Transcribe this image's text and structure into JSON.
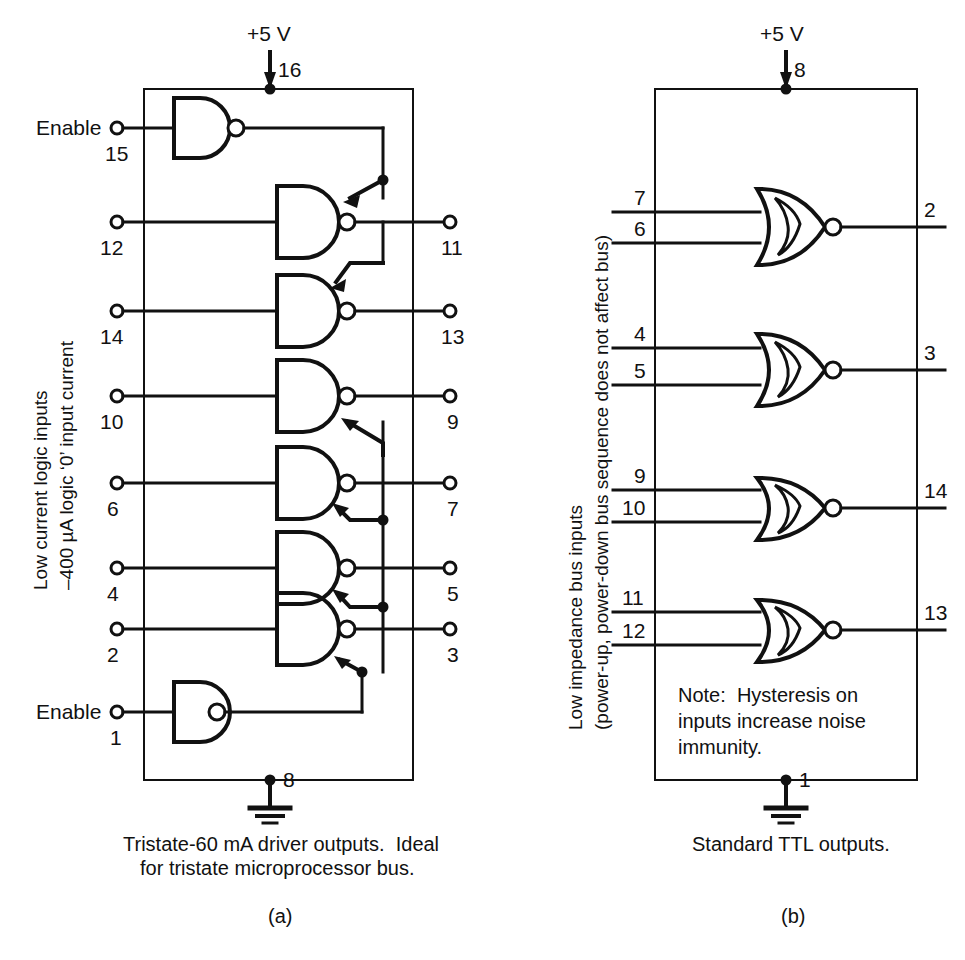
{
  "figure": {
    "stroke_color": "#111111",
    "background_color": "#ffffff"
  },
  "panel_a": {
    "id": "a",
    "figure_label": "(a)",
    "supply_label": "+5 V",
    "supply_pin": "16",
    "ground_pin": "8",
    "side_label_line1": "Low current logic inputs",
    "side_label_line2": "–400 µA logic ‘0’ input current",
    "caption_line1": "Tristate-60 mA driver outputs.  Ideal",
    "caption_line2": "for tristate microprocessor bus.",
    "enable_label_top": "Enable",
    "enable_pin_top": "15",
    "enable_label_bottom": "Enable",
    "enable_pin_bottom": "1",
    "gate_type": "NAND",
    "channels": [
      {
        "input_pin": "12",
        "output_pin": "11"
      },
      {
        "input_pin": "14",
        "output_pin": "13"
      },
      {
        "input_pin": "10",
        "output_pin": "9"
      },
      {
        "input_pin": "6",
        "output_pin": "7"
      },
      {
        "input_pin": "4",
        "output_pin": "5"
      },
      {
        "input_pin": "2",
        "output_pin": "3"
      }
    ]
  },
  "panel_b": {
    "id": "b",
    "figure_label": "(b)",
    "supply_label": "+5 V",
    "supply_pin": "8",
    "ground_pin": "1",
    "side_label_line1": "Low impedance bus inputs",
    "side_label_line2": "(power-up, power-down bus sequence does not affect bus)",
    "caption_line1": "Standard TTL outputs.",
    "note_line1": "Note:  Hysteresis on",
    "note_line2": "inputs increase noise",
    "note_line3": "immunity.",
    "gate_type": "NOR-schmitt",
    "channels": [
      {
        "input_pin_top": "7",
        "input_pin_bottom": "6",
        "output_pin": "2"
      },
      {
        "input_pin_top": "4",
        "input_pin_bottom": "5",
        "output_pin": "3"
      },
      {
        "input_pin_top": "9",
        "input_pin_bottom": "10",
        "output_pin": "14"
      },
      {
        "input_pin_top": "11",
        "input_pin_bottom": "12",
        "output_pin": "13"
      }
    ]
  }
}
